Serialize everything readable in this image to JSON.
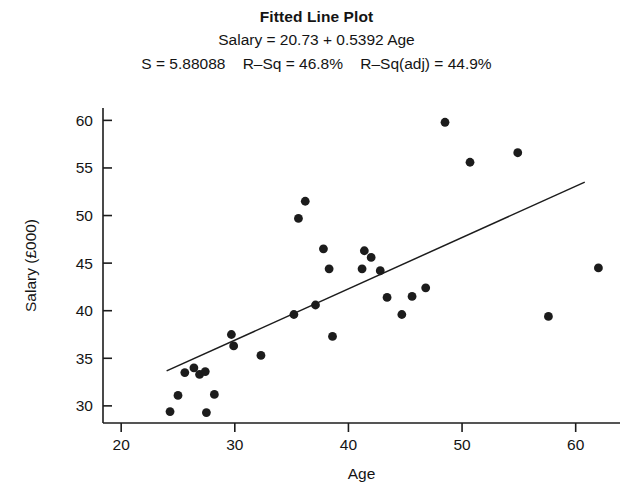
{
  "header": {
    "title": "Fitted Line Plot",
    "equation": "Salary = 20.73 + 0.5392 Age",
    "stat_s_label": "S = 5.88088",
    "stat_rsq_label": "R–Sq = 46.8%",
    "stat_rsqadj_label": "R–Sq(adj) = 44.9%"
  },
  "chart_data": {
    "type": "scatter",
    "title": "Fitted Line Plot",
    "subtitle": "Salary = 20.73 + 0.5392 Age",
    "annotations": [
      "S = 5.88088",
      "R–Sq = 46.8%",
      "R–Sq(adj) = 44.9%"
    ],
    "xlabel": "Age",
    "ylabel": "Salary (£000)",
    "xlim": [
      18.4,
      63.9
    ],
    "ylim": [
      28.2,
      61.3
    ],
    "xticks": [
      20,
      30,
      40,
      50,
      60
    ],
    "yticks": [
      30,
      35,
      40,
      45,
      50,
      55,
      60
    ],
    "grid": false,
    "legend": false,
    "series": [
      {
        "name": "Salary vs Age",
        "marker": "filled-circle",
        "color": "#1c1c1c",
        "points": [
          [
            24.3,
            29.4
          ],
          [
            25.0,
            31.1
          ],
          [
            25.6,
            33.5
          ],
          [
            26.4,
            34.0
          ],
          [
            26.9,
            33.3
          ],
          [
            27.4,
            33.6
          ],
          [
            27.5,
            29.3
          ],
          [
            28.2,
            31.2
          ],
          [
            29.7,
            37.5
          ],
          [
            29.9,
            36.3
          ],
          [
            32.3,
            35.3
          ],
          [
            35.2,
            39.6
          ],
          [
            35.6,
            49.7
          ],
          [
            36.2,
            51.5
          ],
          [
            37.1,
            40.6
          ],
          [
            37.8,
            46.5
          ],
          [
            38.3,
            44.4
          ],
          [
            38.6,
            37.3
          ],
          [
            41.2,
            44.4
          ],
          [
            41.4,
            46.3
          ],
          [
            42.0,
            45.6
          ],
          [
            42.8,
            44.2
          ],
          [
            43.4,
            41.4
          ],
          [
            44.7,
            39.6
          ],
          [
            45.6,
            41.5
          ],
          [
            46.8,
            42.4
          ],
          [
            48.5,
            59.8
          ],
          [
            50.7,
            55.6
          ],
          [
            54.9,
            56.6
          ],
          [
            57.6,
            39.4
          ],
          [
            62.0,
            44.5
          ]
        ]
      }
    ],
    "fit_line": {
      "name": "Fitted regression line",
      "intercept": 20.73,
      "slope": 0.5392,
      "x_start": 24.0,
      "x_end": 60.8,
      "color": "#1c1c1c"
    }
  }
}
